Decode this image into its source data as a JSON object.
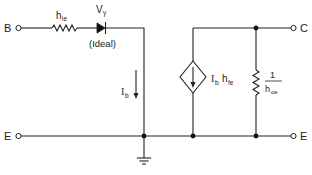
{
  "diagram": {
    "type": "circuit-schematic",
    "terminals": {
      "base": "B",
      "collector": "C",
      "emitter_left": "E",
      "emitter_right": "E"
    },
    "components": {
      "input_resistor": {
        "symbol": "h",
        "subscript": "ie"
      },
      "diode": {
        "symbol": "V",
        "subscript": "γ",
        "note": "(Ideal)"
      },
      "base_current": {
        "symbol": "I",
        "subscript": "b"
      },
      "current_source": {
        "symbol1": "I",
        "sub1": "b",
        "symbol2": "h",
        "sub2": "fe"
      },
      "output_resistor": {
        "numerator": "1",
        "symbol": "h",
        "subscript": "oe"
      }
    },
    "colors": {
      "line": "#222222",
      "background": "#ffffff"
    }
  }
}
